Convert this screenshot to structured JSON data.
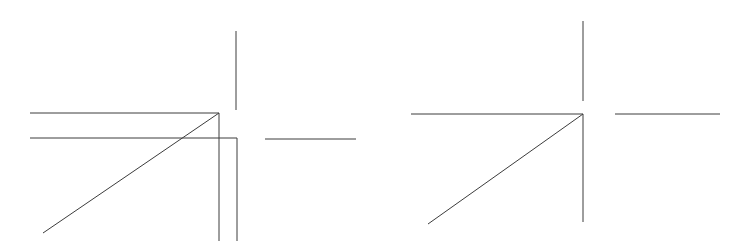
{
  "document": {
    "title": "Line drawing: two corner-and-diagonal figures",
    "background_color": "#ffffff",
    "stroke_color": "#3c3c3c",
    "width": 747,
    "height": 245
  },
  "figures": [
    {
      "id": "left-figure",
      "name": "doubled-corner-diagonal-figure",
      "description": "Corner figure drawn with duplicated, slightly offset lines",
      "segments": [
        {
          "name": "upper-horizontal-line",
          "x1": 30,
          "y1": 113,
          "x2": 219,
          "y2": 113,
          "width": 1.0
        },
        {
          "name": "lower-horizontal-line",
          "x1": 30,
          "y1": 138,
          "x2": 237,
          "y2": 138,
          "width": 1.0
        },
        {
          "name": "upper-vertical-line",
          "x1": 236,
          "y1": 31,
          "x2": 236,
          "y2": 110,
          "width": 1.0
        },
        {
          "name": "lower-vertical-line-inner",
          "x1": 219,
          "y1": 113,
          "x2": 219,
          "y2": 241,
          "width": 1.0
        },
        {
          "name": "lower-vertical-line-outer",
          "x1": 237,
          "y1": 138,
          "x2": 237,
          "y2": 241,
          "width": 1.0
        },
        {
          "name": "diagonal-line",
          "x1": 43,
          "y1": 233,
          "x2": 219,
          "y2": 113,
          "width": 1.0
        }
      ]
    },
    {
      "id": "left-detached-segment",
      "name": "detached-horizontal-segment-left",
      "description": "Isolated short horizontal stroke right of the left figure",
      "segments": [
        {
          "name": "detached-horizontal-line",
          "x1": 265,
          "y1": 139,
          "x2": 356,
          "y2": 139,
          "width": 1.0
        }
      ]
    },
    {
      "id": "right-figure",
      "name": "single-corner-diagonal-figure",
      "description": "Corner figure drawn with single clean lines",
      "segments": [
        {
          "name": "horizontal-line",
          "x1": 411,
          "y1": 114,
          "x2": 583,
          "y2": 114,
          "width": 1.0
        },
        {
          "name": "upper-vertical-line",
          "x1": 583,
          "y1": 21,
          "x2": 583,
          "y2": 101,
          "width": 1.0
        },
        {
          "name": "lower-vertical-line",
          "x1": 583,
          "y1": 114,
          "x2": 583,
          "y2": 222,
          "width": 1.0
        },
        {
          "name": "diagonal-line",
          "x1": 428,
          "y1": 224,
          "x2": 583,
          "y2": 114,
          "width": 1.0
        }
      ]
    },
    {
      "id": "right-detached-segment",
      "name": "detached-horizontal-segment-right",
      "description": "Isolated short horizontal stroke right of the right figure",
      "segments": [
        {
          "name": "detached-horizontal-line",
          "x1": 615,
          "y1": 114,
          "x2": 720,
          "y2": 114,
          "width": 1.0
        }
      ]
    }
  ]
}
